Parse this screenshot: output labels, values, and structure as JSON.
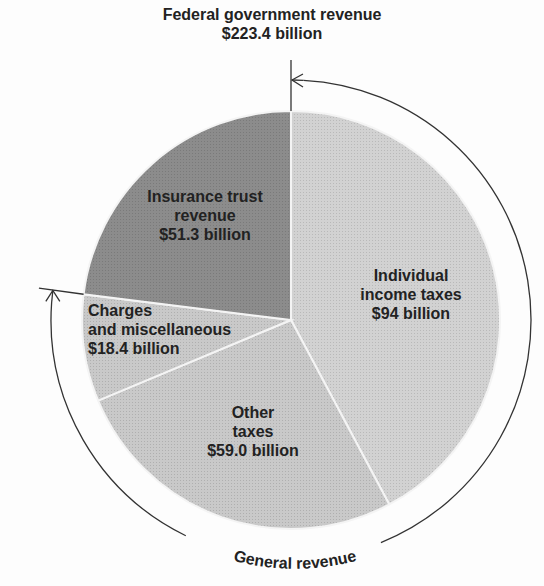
{
  "chart_data": {
    "type": "pie",
    "title": "Federal government revenue",
    "subtitle": "$223.4 billion",
    "total": 223.4,
    "unit": "billion USD",
    "start_angle_deg": 0,
    "direction": "clockwise",
    "slices": [
      {
        "label": "Individual income taxes",
        "value": 94.0,
        "value_label": "$94 billion",
        "color": "#cfcfcf",
        "group": "General revenue"
      },
      {
        "label": "Other taxes",
        "value": 59.0,
        "value_label": "$59.0 billion",
        "color": "#c8c8c8",
        "group": "General revenue"
      },
      {
        "label": "Charges and miscellaneous",
        "value": 18.4,
        "value_label": "$18.4 billion",
        "color": "#c4c4c4",
        "group": "General revenue"
      },
      {
        "label": "Insurance trust revenue",
        "value": 51.3,
        "value_label": "$51.3 billion",
        "color": "#8a8a8a",
        "group": ""
      }
    ],
    "annotations": [
      {
        "text": "General revenue",
        "type": "bracket-arc",
        "spans": [
          "Individual income taxes",
          "Other taxes",
          "Charges and miscellaneous"
        ]
      }
    ],
    "legend": "none (inline labels)"
  },
  "header": {
    "title": "Federal government revenue",
    "total": "$223.4 billion"
  },
  "labels": {
    "individual": [
      "Individual",
      "income taxes",
      "$94 billion"
    ],
    "other": [
      "Other",
      "taxes",
      "$59.0 billion"
    ],
    "charges": [
      "Charges",
      "and miscellaneous",
      "$18.4 billion"
    ],
    "insurance": [
      "Insurance trust",
      "revenue",
      "$51.3 billion"
    ],
    "general_revenue": "General revenue"
  }
}
